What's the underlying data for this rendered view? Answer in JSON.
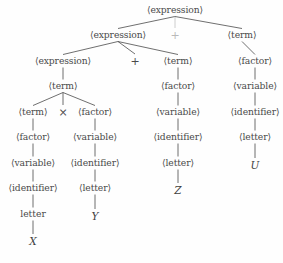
{
  "figure": {
    "kind": "parse-tree",
    "ink_color": "#4a4a4a",
    "background_color": "#fefefe",
    "width": 283,
    "height": 263
  },
  "nodes": [
    {
      "id": "n0",
      "label": "⟨expression⟩",
      "kind": "nonterminal",
      "x": 175,
      "y": 10,
      "faint": false
    },
    {
      "id": "n1",
      "label": "⟨expression⟩",
      "kind": "nonterminal",
      "x": 118,
      "y": 35,
      "faint": false
    },
    {
      "id": "n2",
      "label": "+",
      "kind": "operator",
      "x": 175,
      "y": 35,
      "faint": true
    },
    {
      "id": "n3",
      "label": "⟨term⟩",
      "kind": "nonterminal",
      "x": 242,
      "y": 35,
      "faint": false
    },
    {
      "id": "n4",
      "label": "⟨expression⟩",
      "kind": "nonterminal",
      "x": 63,
      "y": 61,
      "faint": false
    },
    {
      "id": "n5",
      "label": "+",
      "kind": "operator",
      "x": 135,
      "y": 61,
      "faint": false
    },
    {
      "id": "n6",
      "label": "⟨term⟩",
      "kind": "nonterminal",
      "x": 178,
      "y": 61,
      "faint": false
    },
    {
      "id": "n7",
      "label": "⟨factor⟩",
      "kind": "nonterminal",
      "x": 255,
      "y": 61,
      "faint": false
    },
    {
      "id": "n8",
      "label": "⟨term⟩",
      "kind": "nonterminal",
      "x": 63,
      "y": 86,
      "faint": false
    },
    {
      "id": "n9",
      "label": "⟨factor⟩",
      "kind": "nonterminal",
      "x": 178,
      "y": 86,
      "faint": false
    },
    {
      "id": "n10",
      "label": "⟨variable⟩",
      "kind": "nonterminal",
      "x": 255,
      "y": 86,
      "faint": false
    },
    {
      "id": "n11",
      "label": "⟨term⟩",
      "kind": "nonterminal",
      "x": 33,
      "y": 112,
      "faint": false
    },
    {
      "id": "n12",
      "label": "×",
      "kind": "operator",
      "x": 63,
      "y": 112,
      "faint": false
    },
    {
      "id": "n13",
      "label": "⟨factor⟩",
      "kind": "nonterminal",
      "x": 95,
      "y": 112,
      "faint": false
    },
    {
      "id": "n14",
      "label": "⟨variable⟩",
      "kind": "nonterminal",
      "x": 178,
      "y": 112,
      "faint": false
    },
    {
      "id": "n15",
      "label": "⟨identifier⟩",
      "kind": "nonterminal",
      "x": 255,
      "y": 112,
      "faint": false
    },
    {
      "id": "n16",
      "label": "⟨factor⟩",
      "kind": "nonterminal",
      "x": 33,
      "y": 137,
      "faint": false
    },
    {
      "id": "n17",
      "label": "⟨variable⟩",
      "kind": "nonterminal",
      "x": 95,
      "y": 137,
      "faint": false
    },
    {
      "id": "n18",
      "label": "⟨identifier⟩",
      "kind": "nonterminal",
      "x": 178,
      "y": 137,
      "faint": false
    },
    {
      "id": "n19",
      "label": "⟨letter⟩",
      "kind": "nonterminal",
      "x": 255,
      "y": 137,
      "faint": false
    },
    {
      "id": "n20",
      "label": "⟨variable⟩",
      "kind": "nonterminal",
      "x": 33,
      "y": 163,
      "faint": false
    },
    {
      "id": "n21",
      "label": "⟨identifier⟩",
      "kind": "nonterminal",
      "x": 95,
      "y": 163,
      "faint": false
    },
    {
      "id": "n22",
      "label": "⟨letter⟩",
      "kind": "nonterminal",
      "x": 178,
      "y": 163,
      "faint": false
    },
    {
      "id": "n23",
      "label": "U",
      "kind": "terminal",
      "x": 255,
      "y": 165,
      "faint": false
    },
    {
      "id": "n24",
      "label": "⟨identifier⟩",
      "kind": "nonterminal",
      "x": 33,
      "y": 188,
      "faint": false
    },
    {
      "id": "n25",
      "label": "⟨letter⟩",
      "kind": "nonterminal",
      "x": 95,
      "y": 188,
      "faint": false
    },
    {
      "id": "n26",
      "label": "Z",
      "kind": "terminal",
      "x": 178,
      "y": 190,
      "faint": false
    },
    {
      "id": "n27",
      "label": "letter",
      "kind": "plain",
      "x": 33,
      "y": 214,
      "faint": false
    },
    {
      "id": "n28",
      "label": "Y",
      "kind": "terminal",
      "x": 95,
      "y": 216,
      "faint": false
    },
    {
      "id": "n29",
      "label": "X",
      "kind": "terminal",
      "x": 33,
      "y": 241,
      "faint": false
    }
  ],
  "edges": [
    {
      "from": "n0",
      "to": "n1"
    },
    {
      "from": "n0",
      "to": "n2"
    },
    {
      "from": "n0",
      "to": "n3"
    },
    {
      "from": "n1",
      "to": "n4"
    },
    {
      "from": "n1",
      "to": "n5"
    },
    {
      "from": "n1",
      "to": "n6"
    },
    {
      "from": "n3",
      "to": "n7"
    },
    {
      "from": "n4",
      "to": "n8"
    },
    {
      "from": "n6",
      "to": "n9"
    },
    {
      "from": "n7",
      "to": "n10"
    },
    {
      "from": "n8",
      "to": "n11"
    },
    {
      "from": "n8",
      "to": "n12"
    },
    {
      "from": "n8",
      "to": "n13"
    },
    {
      "from": "n9",
      "to": "n14"
    },
    {
      "from": "n10",
      "to": "n15"
    },
    {
      "from": "n11",
      "to": "n16"
    },
    {
      "from": "n13",
      "to": "n17"
    },
    {
      "from": "n14",
      "to": "n18"
    },
    {
      "from": "n15",
      "to": "n19"
    },
    {
      "from": "n16",
      "to": "n20"
    },
    {
      "from": "n17",
      "to": "n21"
    },
    {
      "from": "n18",
      "to": "n22"
    },
    {
      "from": "n19",
      "to": "n23"
    },
    {
      "from": "n20",
      "to": "n24"
    },
    {
      "from": "n21",
      "to": "n25"
    },
    {
      "from": "n22",
      "to": "n26"
    },
    {
      "from": "n24",
      "to": "n27"
    },
    {
      "from": "n25",
      "to": "n28"
    },
    {
      "from": "n27",
      "to": "n29"
    }
  ]
}
